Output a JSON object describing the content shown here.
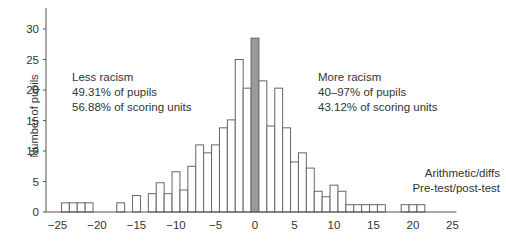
{
  "chart_data": {
    "type": "bar",
    "title": "",
    "xlabel": "",
    "ylabel": "Number of pupils",
    "xlim": [
      -26,
      26
    ],
    "ylim": [
      0,
      33
    ],
    "x_ticks": [
      -25,
      -20,
      -15,
      -10,
      -5,
      0,
      5,
      10,
      15,
      20,
      25
    ],
    "y_ticks": [
      0,
      5,
      10,
      15,
      20,
      25,
      30
    ],
    "grid": false,
    "bin_width": 1,
    "x": [
      -24,
      -23,
      -22,
      -21,
      -17,
      -15,
      -13,
      -12,
      -11,
      -10,
      -9,
      -8,
      -7,
      -6,
      -5,
      -4,
      -3,
      -2,
      -1,
      0,
      1,
      2,
      3,
      4,
      5,
      6,
      7,
      8,
      9,
      10,
      11,
      12,
      13,
      14,
      15,
      16,
      19,
      20,
      21
    ],
    "values": [
      1.5,
      1.5,
      1.5,
      1.5,
      1.5,
      2.7,
      3,
      4.8,
      3,
      6.6,
      3.6,
      7.5,
      11,
      9.7,
      11,
      13.8,
      15.1,
      25,
      20.3,
      28.5,
      21.5,
      14.1,
      20.3,
      13.8,
      8.2,
      9.7,
      7.2,
      3.4,
      2.5,
      4.4,
      3.4,
      1.2,
      1.2,
      1.2,
      1.2,
      1.2,
      1.2,
      1.2,
      1.2
    ],
    "highlight": {
      "x": 0,
      "color": "#9a9a9a"
    },
    "bar_fill": "#ffffff",
    "bar_stroke": "#666666",
    "annotations": [
      {
        "id": "less",
        "lines": [
          "Less racism",
          "49.31% of pupils",
          "56.88% of scoring units"
        ]
      },
      {
        "id": "more",
        "lines": [
          "More racism",
          "40–97% of pupils",
          "43.12% of scoring units"
        ]
      },
      {
        "id": "test",
        "lines": [
          "Arithmetic/diffs",
          "Pre-test/post-test"
        ]
      }
    ],
    "legend": null
  }
}
